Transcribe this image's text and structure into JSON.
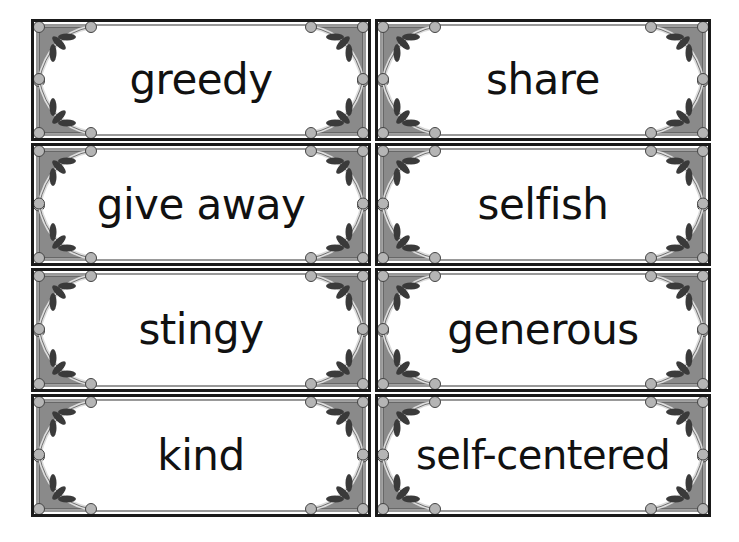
{
  "cards": [
    {
      "word": "greedy"
    },
    {
      "word": "share"
    },
    {
      "word": "give away"
    },
    {
      "word": "selfish"
    },
    {
      "word": "stingy"
    },
    {
      "word": "generous"
    },
    {
      "word": "kind"
    },
    {
      "word": "self-centered"
    }
  ],
  "colors": {
    "border": "#1a1a1a",
    "frame_fill": "#8a8a8a",
    "leaf": "#3a3a3a",
    "bead": "#b5b5b5"
  }
}
